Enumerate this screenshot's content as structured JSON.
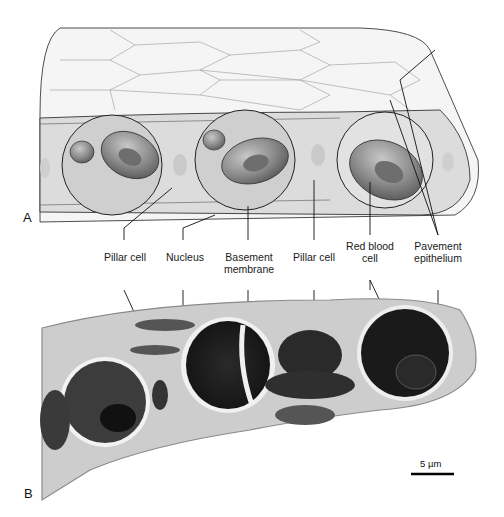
{
  "figure": {
    "panels": [
      {
        "id": "A",
        "label": "A",
        "description": "Schematic drawing of lung alveolar capillary wall with pillar cells and red blood cells"
      },
      {
        "id": "B",
        "label": "B",
        "description": "Transmission electron micrograph of same structure"
      }
    ],
    "labels": [
      {
        "id": "pillar-cell-1",
        "text": "Pillar cell"
      },
      {
        "id": "nucleus",
        "text": "Nucleus"
      },
      {
        "id": "basement-membrane",
        "text": "Basement\nmembrane"
      },
      {
        "id": "pillar-cell-2",
        "text": "Pillar cell"
      },
      {
        "id": "red-blood-cell",
        "text": "Red blood\ncell"
      },
      {
        "id": "pavement-epithelium",
        "text": "Pavement\nepithelium"
      }
    ],
    "scale_bar": {
      "text": "5 µm",
      "value": 5,
      "unit": "µm"
    },
    "colors": {
      "epithelium": "#f4f4f4",
      "channel": "#d9d9d9",
      "rbc_outer": "#7a7a7a",
      "rbc_inner": "#5a5a5a",
      "em_background": "#cfcfcf",
      "em_dark": "#1c1c1c"
    }
  }
}
